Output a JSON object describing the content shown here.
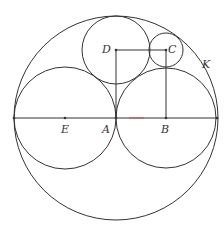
{
  "figure": {
    "stroke_color": "#333333",
    "accent_color": "#d9455a",
    "circles": [
      {
        "name": "K",
        "cx": 116,
        "cy": 118,
        "r": 102
      },
      {
        "name": "E",
        "cx": 65,
        "cy": 118,
        "r": 51
      },
      {
        "name": "B",
        "cx": 166,
        "cy": 118,
        "r": 50
      },
      {
        "name": "D",
        "cx": 116,
        "cy": 50,
        "r": 34
      },
      {
        "name": "C",
        "cx": 166,
        "cy": 50,
        "r": 17
      }
    ],
    "segments": [
      {
        "name": "diameter",
        "from": [
          14,
          118
        ],
        "to": [
          217,
          118
        ]
      },
      {
        "name": "DA",
        "from": [
          116,
          50
        ],
        "to": [
          116,
          118
        ]
      },
      {
        "name": "DC",
        "from": [
          116,
          50
        ],
        "to": [
          166,
          50
        ]
      },
      {
        "name": "CB",
        "from": [
          166,
          50
        ],
        "to": [
          166,
          118
        ]
      }
    ],
    "points": [
      {
        "name": "left-end",
        "x": 14,
        "y": 118
      },
      {
        "name": "E",
        "x": 65,
        "y": 118
      },
      {
        "name": "A",
        "x": 116,
        "y": 118
      },
      {
        "name": "B",
        "x": 166,
        "y": 118
      },
      {
        "name": "right-end",
        "x": 217,
        "y": 118
      },
      {
        "name": "D",
        "x": 116,
        "y": 50
      },
      {
        "name": "C",
        "x": 166,
        "y": 50
      }
    ],
    "labels": {
      "E": "E",
      "A": "A",
      "B": "B",
      "D": "D",
      "C": "C",
      "K": "K"
    }
  }
}
